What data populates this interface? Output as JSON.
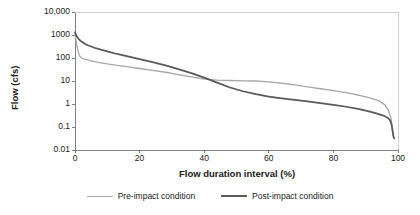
{
  "chart_data": {
    "type": "line",
    "title": "",
    "xlabel": "Flow duration interval (%)",
    "ylabel": "Flow (cfs)",
    "xlim": [
      0,
      100
    ],
    "ylim": [
      0.01,
      10000
    ],
    "yscale": "log",
    "xscale": "linear",
    "grid": false,
    "legend_position": "bottom",
    "xticks": [
      "0",
      "20",
      "40",
      "60",
      "80",
      "100"
    ],
    "xtick_values": [
      0,
      20,
      40,
      60,
      80,
      100
    ],
    "yticks": [
      "10,000",
      "1000",
      "100",
      "10",
      "1",
      "0.1",
      "0.01"
    ],
    "ytick_values": [
      10000,
      1000,
      100,
      10,
      1,
      0.1,
      0.01
    ],
    "colors": {
      "pre_impact": "#a6a6a6",
      "post_impact": "#595959",
      "axis": "#808080",
      "text": "#1a1a1a"
    },
    "series": [
      {
        "name": "Pre-impact condition",
        "color": "#a6a6a6",
        "x": [
          0,
          0.5,
          1,
          1.5,
          2,
          3,
          4,
          6,
          8,
          10,
          13,
          16,
          20,
          24,
          28,
          32,
          36,
          40,
          44,
          48,
          52,
          56,
          60,
          64,
          68,
          72,
          76,
          80,
          84,
          88,
          91,
          94,
          96,
          97,
          97.8,
          98.2,
          98.5,
          98.8
        ],
        "y": [
          1000,
          400,
          180,
          120,
          100,
          90,
          82,
          70,
          62,
          56,
          48,
          42,
          35,
          29,
          24,
          19,
          15,
          12,
          11,
          10.5,
          10.2,
          10,
          9.2,
          8,
          6.8,
          5.6,
          4.6,
          3.8,
          3.1,
          2.4,
          1.9,
          1.4,
          0.9,
          0.55,
          0.25,
          0.09,
          0.04,
          0.032
        ]
      },
      {
        "name": "Post-impact condition",
        "color": "#595959",
        "x": [
          0,
          0.5,
          1,
          2,
          3,
          4,
          6,
          8,
          10,
          13,
          16,
          20,
          24,
          28,
          32,
          36,
          40,
          44,
          48,
          52,
          56,
          60,
          64,
          68,
          72,
          76,
          80,
          84,
          88,
          91,
          93,
          95,
          96,
          97,
          97.5,
          98,
          98.3,
          98.6,
          98.8
        ],
        "y": [
          1300,
          900,
          700,
          520,
          420,
          360,
          280,
          230,
          195,
          150,
          120,
          90,
          66,
          48,
          33,
          22,
          14,
          8.5,
          5.2,
          3.6,
          2.7,
          2.1,
          1.75,
          1.5,
          1.3,
          1.1,
          0.92,
          0.76,
          0.6,
          0.48,
          0.4,
          0.33,
          0.29,
          0.24,
          0.2,
          0.13,
          0.07,
          0.04,
          0.032
        ]
      }
    ]
  },
  "legend": {
    "items": [
      {
        "label": "Pre-impact condition"
      },
      {
        "label": "Post-impact condition"
      }
    ]
  }
}
